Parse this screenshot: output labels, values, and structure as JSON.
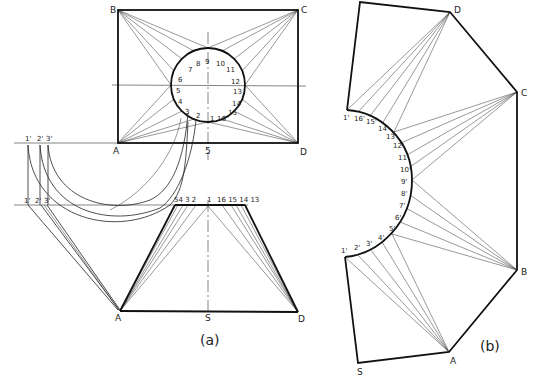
{
  "figure": {
    "panel_a": {
      "caption": "(a)",
      "top_view": {
        "corners": {
          "A": "A",
          "B": "B",
          "C": "C",
          "D": "D"
        },
        "center_label": "5",
        "circle_points": [
          "1",
          "2",
          "3",
          "4",
          "5",
          "6",
          "7",
          "8",
          "9",
          "10",
          "11",
          "12",
          "13",
          "14",
          "15",
          "16"
        ]
      },
      "true_length_upper": [
        "1'",
        "2'",
        "3'"
      ],
      "true_length_lower": [
        "1'",
        "2'",
        "3'"
      ],
      "front_view": {
        "top_labels_left": "54 3 2",
        "top_label_center": "1",
        "top_labels_right": "16 15 14 13",
        "bottom": {
          "A": "A",
          "S": "S",
          "D": "D"
        }
      }
    },
    "panel_b": {
      "caption": "(b)",
      "vertices": {
        "D": "D",
        "C": "C",
        "B": "B",
        "A": "A",
        "S": "S"
      },
      "arc_labels": [
        "1'",
        "16'",
        "15'",
        "14'",
        "13'",
        "12'",
        "11'",
        "10'",
        "9'",
        "8'",
        "7'",
        "6'",
        "5'",
        "4'",
        "3'",
        "2'",
        "1'"
      ]
    }
  }
}
